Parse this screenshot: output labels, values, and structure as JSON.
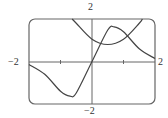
{
  "chart_data": {
    "type": "line",
    "title": "",
    "xlabel": "",
    "ylabel": "",
    "xlim": [
      -2,
      2
    ],
    "ylim": [
      -2,
      2
    ],
    "grid": false,
    "x_ticks": [
      -1,
      1
    ],
    "tick_labels": {
      "x_left": "−2",
      "x_right": "2",
      "y_top": "2",
      "y_bottom": "−2"
    },
    "series": [
      {
        "name": "f",
        "description": "odd S-shaped curve through origin, max ≈1.64 at x≈0.7, min ≈-1.64 at x≈-0.7",
        "x": [
          -2,
          -1.5,
          -1,
          -0.7,
          -0.5,
          0,
          0.5,
          0.7,
          1,
          1.5,
          2
        ],
        "y": [
          -0.14,
          -0.6,
          -1.4,
          -1.63,
          -1.48,
          0,
          1.48,
          1.63,
          1.4,
          0.6,
          0.14
        ]
      },
      {
        "name": "g",
        "description": "upward parabola, min ≈0.8 at x≈0.5",
        "x": [
          -0.63,
          -0.5,
          0,
          0.5,
          1,
          1.5,
          1.6
        ],
        "y": [
          2.0,
          1.8,
          1.05,
          0.8,
          1.05,
          1.8,
          2.0
        ]
      }
    ]
  },
  "labels": {
    "x_left": "−2",
    "x_right": "2",
    "y_top": "2",
    "y_bottom": "−2"
  }
}
